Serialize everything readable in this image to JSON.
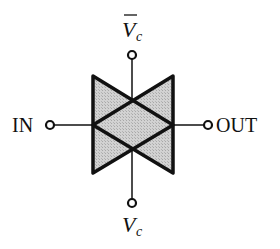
{
  "diagram": {
    "labels": {
      "input": "IN",
      "output": "OUT",
      "control_top_main": "V",
      "control_top_sub": "c",
      "control_top_overbar": true,
      "control_bottom_main": "V",
      "control_bottom_sub": "c"
    },
    "colors": {
      "stroke": "#111111",
      "fill": "#c8c8c8",
      "background": "#ffffff"
    }
  }
}
